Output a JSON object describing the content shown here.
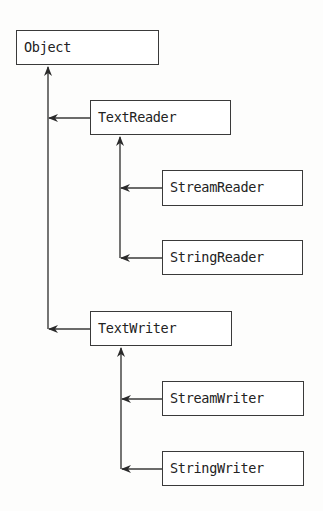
{
  "diagram": {
    "type": "class-hierarchy",
    "nodes": [
      {
        "id": "object",
        "label": "Object"
      },
      {
        "id": "textreader",
        "label": "TextReader",
        "parent": "object"
      },
      {
        "id": "streamreader",
        "label": "StreamReader",
        "parent": "textreader"
      },
      {
        "id": "stringreader",
        "label": "StringReader",
        "parent": "textreader"
      },
      {
        "id": "textwriter",
        "label": "TextWriter",
        "parent": "object"
      },
      {
        "id": "streamwriter",
        "label": "StreamWriter",
        "parent": "textwriter"
      },
      {
        "id": "stringwriter",
        "label": "StringWriter",
        "parent": "textwriter"
      }
    ],
    "edges": [
      {
        "from": "textreader",
        "to": "object"
      },
      {
        "from": "textwriter",
        "to": "object"
      },
      {
        "from": "streamreader",
        "to": "textreader"
      },
      {
        "from": "stringreader",
        "to": "textreader"
      },
      {
        "from": "streamwriter",
        "to": "textwriter"
      },
      {
        "from": "stringwriter",
        "to": "textwriter"
      }
    ],
    "colors": {
      "line": "#3a3a3a",
      "text": "#222222",
      "box_fill": "#ffffff"
    }
  }
}
